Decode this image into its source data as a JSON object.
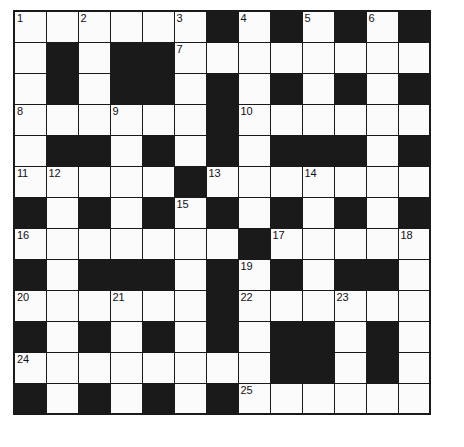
{
  "puzzle": {
    "type": "crossword-grid",
    "rows": 13,
    "columns": 13,
    "cell_size_px": 32,
    "colors": {
      "white_cell": "#fbfbfb",
      "black_cell": "#1a1a1a",
      "grid_line": "#1a1a1a",
      "number_text": "#111111",
      "page_background": "#ffffff"
    },
    "grid": [
      [
        "W",
        "W",
        "W",
        "W",
        "W",
        "W",
        "B",
        "W",
        "B",
        "W",
        "B",
        "W",
        "B"
      ],
      [
        "W",
        "B",
        "W",
        "B",
        "B",
        "W",
        "W",
        "W",
        "W",
        "W",
        "W",
        "W",
        "W"
      ],
      [
        "W",
        "B",
        "W",
        "B",
        "B",
        "W",
        "B",
        "W",
        "B",
        "W",
        "B",
        "W",
        "B"
      ],
      [
        "W",
        "W",
        "W",
        "W",
        "W",
        "W",
        "B",
        "W",
        "W",
        "W",
        "W",
        "W",
        "W"
      ],
      [
        "W",
        "B",
        "B",
        "W",
        "B",
        "W",
        "B",
        "W",
        "B",
        "B",
        "B",
        "W",
        "B"
      ],
      [
        "W",
        "W",
        "W",
        "W",
        "W",
        "B",
        "W",
        "W",
        "W",
        "W",
        "W",
        "W",
        "W"
      ],
      [
        "B",
        "W",
        "B",
        "W",
        "B",
        "W",
        "B",
        "W",
        "B",
        "W",
        "B",
        "W",
        "B"
      ],
      [
        "W",
        "W",
        "W",
        "W",
        "W",
        "W",
        "W",
        "B",
        "W",
        "W",
        "W",
        "W",
        "W"
      ],
      [
        "B",
        "W",
        "B",
        "B",
        "B",
        "W",
        "B",
        "W",
        "B",
        "W",
        "B",
        "B",
        "W"
      ],
      [
        "W",
        "W",
        "W",
        "W",
        "W",
        "W",
        "B",
        "W",
        "W",
        "W",
        "W",
        "W",
        "W"
      ],
      [
        "B",
        "W",
        "B",
        "W",
        "B",
        "W",
        "B",
        "W",
        "B",
        "B",
        "W",
        "B",
        "W"
      ],
      [
        "W",
        "W",
        "W",
        "W",
        "W",
        "W",
        "W",
        "W",
        "B",
        "B",
        "W",
        "B",
        "W"
      ],
      [
        "B",
        "W",
        "B",
        "W",
        "B",
        "W",
        "B",
        "W",
        "W",
        "W",
        "W",
        "W",
        "W"
      ]
    ],
    "numbers": [
      {
        "row": 1,
        "col": 1,
        "label": "1"
      },
      {
        "row": 1,
        "col": 3,
        "label": "2"
      },
      {
        "row": 1,
        "col": 6,
        "label": "3"
      },
      {
        "row": 1,
        "col": 8,
        "label": "4"
      },
      {
        "row": 1,
        "col": 10,
        "label": "5"
      },
      {
        "row": 1,
        "col": 12,
        "label": "6"
      },
      {
        "row": 2,
        "col": 6,
        "label": "7"
      },
      {
        "row": 4,
        "col": 1,
        "label": "8"
      },
      {
        "row": 4,
        "col": 4,
        "label": "9"
      },
      {
        "row": 4,
        "col": 8,
        "label": "10"
      },
      {
        "row": 6,
        "col": 1,
        "label": "11"
      },
      {
        "row": 6,
        "col": 2,
        "label": "12"
      },
      {
        "row": 6,
        "col": 7,
        "label": "13"
      },
      {
        "row": 6,
        "col": 10,
        "label": "14"
      },
      {
        "row": 7,
        "col": 6,
        "label": "15"
      },
      {
        "row": 8,
        "col": 1,
        "label": "16"
      },
      {
        "row": 8,
        "col": 9,
        "label": "17"
      },
      {
        "row": 8,
        "col": 13,
        "label": "18"
      },
      {
        "row": 9,
        "col": 8,
        "label": "19"
      },
      {
        "row": 10,
        "col": 1,
        "label": "20"
      },
      {
        "row": 10,
        "col": 4,
        "label": "21"
      },
      {
        "row": 10,
        "col": 8,
        "label": "22"
      },
      {
        "row": 10,
        "col": 11,
        "label": "23"
      },
      {
        "row": 12,
        "col": 1,
        "label": "24"
      },
      {
        "row": 13,
        "col": 8,
        "label": "25"
      }
    ]
  }
}
